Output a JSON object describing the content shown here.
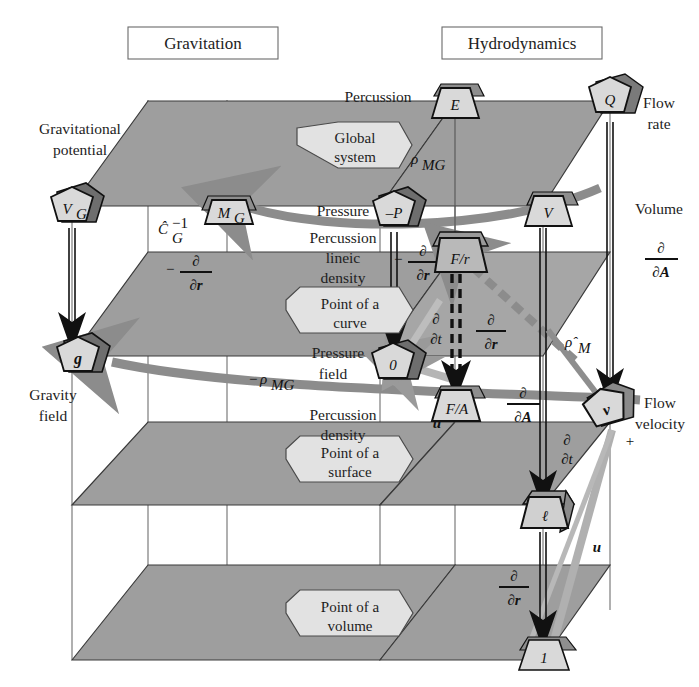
{
  "titles": {
    "left": "Gravitation",
    "right": "Hydrodynamics"
  },
  "hexagons": [
    {
      "id": "global-system",
      "line1": "Global",
      "line2": "system",
      "x": 352,
      "y": 145
    },
    {
      "id": "point-of-a-curve",
      "line1": "Point of a",
      "line2": "curve",
      "x": 345,
      "y": 315
    },
    {
      "id": "point-of-a-surface",
      "line1": "Point of a",
      "line2": "surface",
      "x": 345,
      "y": 464
    },
    {
      "id": "point-of-a-volume",
      "line1": "Point of a",
      "line2": "volume",
      "x": 345,
      "y": 618
    }
  ],
  "side_labels": [
    {
      "id": "gravitational-potential",
      "line1": "Gravitational",
      "line2": "potential",
      "x": 78,
      "y": 129,
      "align": "middle"
    },
    {
      "id": "gravity-field",
      "line1": "Gravity",
      "line2": "field",
      "x": 52,
      "y": 393,
      "align": "middle"
    },
    {
      "id": "percussion-top",
      "line1": "Percussion",
      "line2": "",
      "x": 380,
      "y": 97,
      "align": "middle"
    },
    {
      "id": "pressure",
      "line1": "Pressure",
      "line2": "",
      "x": 345,
      "y": 212,
      "align": "middle"
    },
    {
      "id": "percussion-lineic-density",
      "line1": "Percussion",
      "line2": "lineic",
      "line3": "density",
      "x": 345,
      "y": 241,
      "align": "middle"
    },
    {
      "id": "pressure-field",
      "line1": "Pressure",
      "line2": "field",
      "x": 340,
      "y": 353,
      "align": "middle"
    },
    {
      "id": "percussion-density",
      "line1": "Percussion",
      "line2": "density",
      "x": 345,
      "y": 416,
      "align": "middle"
    },
    {
      "id": "flow-rate",
      "line1": "Flow",
      "line2": "rate",
      "x": 660,
      "y": 103,
      "align": "middle"
    },
    {
      "id": "volume",
      "line1": "Volume",
      "line2": "",
      "x": 662,
      "y": 209,
      "align": "middle"
    },
    {
      "id": "flow-velocity",
      "line1": "Flow",
      "line2": "velocity",
      "x": 662,
      "y": 404,
      "align": "middle"
    }
  ],
  "nodes": [
    {
      "id": "V_G",
      "label": "V",
      "sub": "G",
      "shape": "pentagon",
      "x": 72,
      "y": 206
    },
    {
      "id": "g",
      "label": "g",
      "sub": "",
      "shape": "pentagon",
      "x": 78,
      "y": 356
    },
    {
      "id": "M_G",
      "label": "M",
      "sub": "G",
      "shape": "trapezoid",
      "x": 227,
      "y": 212
    },
    {
      "id": "E",
      "label": "E",
      "sub": "",
      "shape": "trapezoid",
      "x": 455,
      "y": 101
    },
    {
      "id": "Q",
      "label": "Q",
      "sub": "",
      "shape": "pentagon",
      "x": 610,
      "y": 100
    },
    {
      "id": "minusP",
      "label": "–P",
      "sub": "",
      "shape": "pentagon",
      "x": 394,
      "y": 210
    },
    {
      "id": "V",
      "label": "V",
      "sub": "",
      "shape": "trapezoid",
      "x": 548,
      "y": 208
    },
    {
      "id": "F_over_r",
      "label": "F/r",
      "sub": "",
      "shape": "trapezoid3d",
      "x": 455,
      "y": 252
    },
    {
      "id": "zero",
      "label": "0",
      "sub": "",
      "shape": "pentagon",
      "x": 393,
      "y": 362
    },
    {
      "id": "F_over_A",
      "label": "F/A",
      "sub": "",
      "shape": "trapezoid",
      "x": 456,
      "y": 404
    },
    {
      "id": "v",
      "label": "v",
      "sub": "",
      "shape": "pentagon3d",
      "x": 607,
      "y": 412
    },
    {
      "id": "ell",
      "label": "ℓ",
      "sub": "",
      "shape": "trapezoid3d",
      "x": 543,
      "y": 513
    },
    {
      "id": "one",
      "label": "1",
      "sub": "",
      "shape": "trapezoid",
      "x": 544,
      "y": 655
    }
  ],
  "operators": [
    {
      "id": "op-C-G-inv",
      "text": "Ĉ",
      "sup": "–1",
      "sub": "G",
      "x": 165,
      "y": 237
    },
    {
      "id": "op-left-dr",
      "num": "∂",
      "den": "∂r",
      "minus": true,
      "x": 195,
      "y": 272
    },
    {
      "id": "op-rho-MG-top",
      "text": "ρ",
      "sub": "MG",
      "x": 418,
      "y": 160
    },
    {
      "id": "op-rho-MG-neg",
      "text": "–ρ",
      "sub": "MG",
      "x": 262,
      "y": 380
    },
    {
      "id": "op-center-dr",
      "num": "∂",
      "den": "∂r",
      "minus": true,
      "x": 425,
      "y": 262
    },
    {
      "id": "op-dt",
      "num": "∂",
      "den": "∂t",
      "minus": false,
      "x": 436,
      "y": 330
    },
    {
      "id": "op-dr-mid",
      "num": "∂",
      "den": "∂r",
      "minus": false,
      "x": 490,
      "y": 330
    },
    {
      "id": "op-dA-mid",
      "num": "∂",
      "den": "∂A",
      "minus": false,
      "x": 522,
      "y": 403
    },
    {
      "id": "op-dA-right",
      "num": "∂",
      "den": "∂A",
      "minus": false,
      "x": 662,
      "y": 258
    },
    {
      "id": "op-rho-M-hat",
      "text": "ρ̂",
      "sub": "M",
      "x": 573,
      "y": 342
    },
    {
      "id": "op-dt-lower",
      "num": "∂",
      "den": "∂t",
      "minus": false,
      "x": 566,
      "y": 450
    },
    {
      "id": "op-dr-lower",
      "num": "∂",
      "den": "∂r",
      "minus": false,
      "x": 513,
      "y": 586
    },
    {
      "id": "op-u-left",
      "text": "u",
      "x": 437,
      "y": 423
    },
    {
      "id": "op-u-right",
      "text": "u",
      "x": 597,
      "y": 547
    },
    {
      "id": "op-plus",
      "text": "+",
      "x": 630,
      "y": 440
    }
  ],
  "colors": {
    "plane_fill": "#9e9e9e",
    "plane_fill_light": "#b4b4b4",
    "node_fill": "#d9d9d9",
    "node_top": "#6e6e6e",
    "hex_fill": "#e2e2e2",
    "arrow_gray": "#8c8c8c",
    "stroke": "#1a1a1a",
    "wire": "#707070"
  }
}
